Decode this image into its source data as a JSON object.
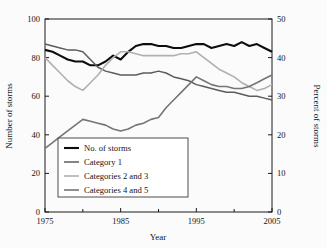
{
  "chart_data": {
    "type": "line",
    "title": "",
    "xlabel": "Year",
    "ylabel": "Number of storms",
    "y2label": "Percent of storms",
    "xlim": [
      1975,
      2005
    ],
    "ylim": [
      0,
      100
    ],
    "y2lim": [
      0,
      50
    ],
    "grid": false,
    "legend_position": "lower-left-inside",
    "xticks": [
      1975,
      1985,
      1995,
      2005
    ],
    "xtick_labels": [
      "1975",
      "1985",
      "1995",
      "2005"
    ],
    "xminor_ticks": [
      1980,
      1990,
      2000
    ],
    "yticks": [
      0,
      20,
      40,
      60,
      80,
      100
    ],
    "ytick_labels": [
      "0",
      "20",
      "40",
      "60",
      "80",
      "100"
    ],
    "y2ticks": [
      0,
      10,
      20,
      30,
      40,
      50
    ],
    "y2tick_labels": [
      "0",
      "10",
      "20",
      "30",
      "40",
      "50"
    ],
    "x": [
      1975,
      1976,
      1977,
      1978,
      1979,
      1980,
      1981,
      1982,
      1983,
      1984,
      1985,
      1986,
      1987,
      1988,
      1989,
      1990,
      1991,
      1992,
      1993,
      1994,
      1995,
      1996,
      1997,
      1998,
      1999,
      2000,
      2001,
      2002,
      2003,
      2004,
      2005
    ],
    "series": [
      {
        "name": "No. of storms",
        "axis": "left",
        "color": "#0d0d0d",
        "width": 2.1,
        "values": [
          84,
          83,
          81,
          79,
          78,
          78,
          76,
          76,
          78,
          81,
          79,
          83,
          86,
          87,
          87,
          86,
          86,
          85,
          85,
          86,
          87,
          87,
          85,
          86,
          87,
          86,
          88,
          86,
          87,
          85,
          83
        ]
      },
      {
        "name": "Category 1",
        "axis": "left",
        "color": "#5c5c5c",
        "width": 1.5,
        "values": [
          87,
          86,
          85,
          84,
          84,
          83,
          79,
          75,
          73,
          72,
          71,
          71,
          71,
          72,
          72,
          73,
          72,
          70,
          69,
          68,
          66,
          65,
          64,
          63,
          62,
          62,
          61,
          60,
          60,
          59,
          58
        ]
      },
      {
        "name": "Categories 2 and 3",
        "axis": "left",
        "color": "#b0b0b0",
        "width": 1.6,
        "values": [
          80,
          76,
          72,
          68,
          65,
          63,
          67,
          71,
          76,
          80,
          83,
          83,
          82,
          81,
          81,
          81,
          81,
          81,
          82,
          82,
          83,
          80,
          77,
          74,
          72,
          70,
          67,
          65,
          63,
          64,
          66
        ]
      },
      {
        "name": "Categories 4 and 5",
        "axis": "left",
        "color": "#757575",
        "width": 1.6,
        "values": [
          33,
          36,
          39,
          42,
          45,
          48,
          47,
          46,
          45,
          43,
          42,
          43,
          45,
          46,
          48,
          49,
          54,
          58,
          62,
          66,
          70,
          68,
          66,
          65,
          65,
          64,
          64,
          65,
          67,
          69,
          71
        ]
      }
    ],
    "legend": [
      {
        "label": "No. of storms",
        "color": "#0d0d0d",
        "width": 2.1
      },
      {
        "label": "Category 1",
        "color": "#5c5c5c",
        "width": 1.5
      },
      {
        "label": "Categories 2 and 3",
        "color": "#b0b0b0",
        "width": 1.6
      },
      {
        "label": "Categories 4 and 5",
        "color": "#757575",
        "width": 1.6
      }
    ]
  }
}
